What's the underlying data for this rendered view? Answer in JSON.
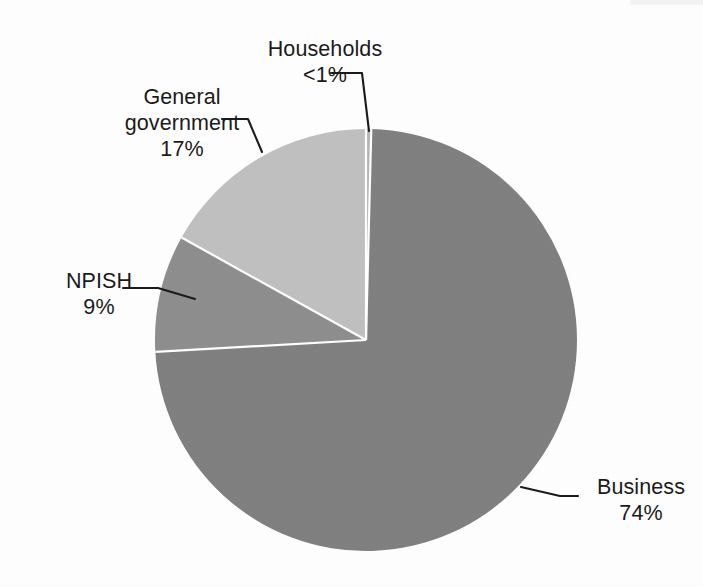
{
  "chart_data": {
    "type": "pie",
    "title": "",
    "subtitle": "",
    "xlabel": "",
    "ylabel": "",
    "legend_position": "none",
    "grid": false,
    "labels_on_chart": true,
    "start_angle_deg": 0,
    "direction": "clockwise",
    "categories": [
      "Business",
      "NPISH",
      "General government",
      "Households"
    ],
    "values": [
      74,
      9,
      17,
      0.4
    ],
    "value_labels": [
      "74%",
      "9%",
      "17%",
      "<1%"
    ],
    "colors": [
      "#808080",
      "#8e8e8e",
      "#c0c0c0",
      "#b5b5b5"
    ],
    "slices": [
      {
        "name": "Business",
        "value": 74,
        "value_label": "74%",
        "color": "#808080",
        "label_lines": [
          "Business",
          "74%"
        ]
      },
      {
        "name": "NPISH",
        "value": 9,
        "value_label": "9%",
        "color": "#8e8e8e",
        "label_lines": [
          "NPISH",
          "9%"
        ]
      },
      {
        "name": "General government",
        "value": 17,
        "value_label": "17%",
        "color": "#c0c0c0",
        "label_lines": [
          "General",
          "government",
          "17%"
        ]
      },
      {
        "name": "Households",
        "value": 0.4,
        "value_label": "<1%",
        "color": "#b5b5b5",
        "label_lines": [
          "Households",
          "<1%"
        ]
      }
    ]
  },
  "labels": {
    "households": {
      "line1": "Households",
      "line2": "<1%"
    },
    "general_government": {
      "line1": "General",
      "line2": "government",
      "line3": "17%"
    },
    "npish": {
      "line1": "NPISH",
      "line2": "9%"
    },
    "business": {
      "line1": "Business",
      "line2": "74%"
    }
  },
  "style": {
    "background": "#ffffff",
    "text_color": "#1a1a1a",
    "leader_line_color": "#1a1a1a",
    "slice_divider_color": "#ffffff"
  }
}
